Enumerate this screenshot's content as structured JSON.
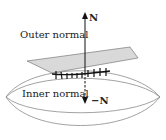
{
  "diagram": {
    "labels": {
      "outer_normal": "Outer normal",
      "inner_normal": "Inner normal",
      "n": "N",
      "minus_n": "−N"
    },
    "colors": {
      "plane_fill": "#d9d9d9",
      "plane_stroke": "#666666",
      "surface_stroke": "#8a8a8a",
      "arrow": "#111111"
    }
  }
}
